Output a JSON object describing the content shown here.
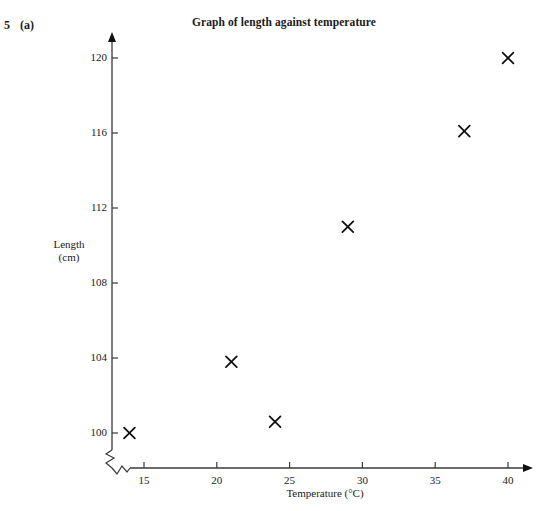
{
  "question": {
    "number": "5",
    "part": "(a)"
  },
  "chart_data": {
    "type": "scatter",
    "title": "Graph of length against temperature",
    "xlabel": "Temperature (°C)",
    "ylabel_line1": "Length",
    "ylabel_line2": "(cm)",
    "xlim": [
      12.5,
      41
    ],
    "ylim": [
      99.2,
      121
    ],
    "xticks": [
      15,
      20,
      25,
      30,
      35,
      40
    ],
    "xtick_labels": [
      "15",
      "20",
      "25",
      "30",
      "35",
      "40"
    ],
    "yticks": [
      100,
      104,
      108,
      112,
      116,
      120
    ],
    "ytick_labels": [
      "100",
      "104",
      "108",
      "112",
      "116",
      "120"
    ],
    "grid": false,
    "legend": null,
    "axis_break": "zigzag-at-origin",
    "marker": "cross",
    "marker_color": "#111111",
    "axis_color": "#3a3a3a",
    "points": [
      {
        "x": 14,
        "y": 100.0
      },
      {
        "x": 21,
        "y": 103.8
      },
      {
        "x": 24,
        "y": 100.6
      },
      {
        "x": 29,
        "y": 111.0
      },
      {
        "x": 37,
        "y": 116.1
      },
      {
        "x": 40,
        "y": 120.0
      }
    ]
  }
}
